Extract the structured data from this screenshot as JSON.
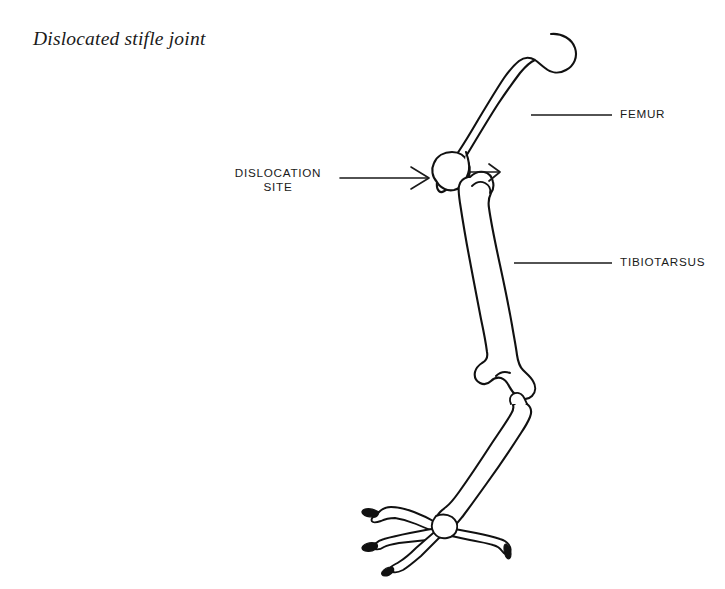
{
  "figure": {
    "title": "Dislocated stifle joint",
    "style": "black and white line drawing",
    "background_color": "#ffffff",
    "line_color": "#111111"
  },
  "annotations": {
    "femur": {
      "label": "FEMUR",
      "leader": "horizontal line from femur shaft to label"
    },
    "tibiotarsus": {
      "label": "TIBIOTARSUS",
      "leader": "horizontal line from tibiotarsus shaft to label"
    },
    "dislocation_site": {
      "line1": "DISLOCATION",
      "line2": "SITE",
      "leader": "horizontal arrow pointing right toward joint"
    }
  },
  "arrows": {
    "main": "long arrow pointing right at dislocation site",
    "detail": "short arrow pointing right at separated joint gap"
  },
  "bones": [
    {
      "name": "femur"
    },
    {
      "name": "tibiotarsus"
    },
    {
      "name": "tarsometatarsus"
    },
    {
      "name": "foot-toes"
    }
  ]
}
